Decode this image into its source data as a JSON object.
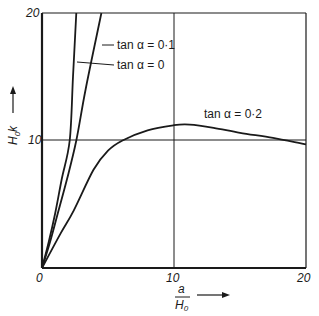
{
  "chart_data": {
    "type": "line",
    "title": "",
    "xlabel": "a/H0",
    "ylabel": "H0k",
    "xlim": [
      0,
      20
    ],
    "ylim": [
      0,
      20
    ],
    "x_ticks": [
      "0",
      "10",
      "20"
    ],
    "y_ticks": [
      "10",
      "20"
    ],
    "grid": "gridlines at x=10 and y=10",
    "legend": "inline labels with leader lines",
    "series": [
      {
        "name": "tan α = 0",
        "label": "tan α = 0",
        "points": [
          [
            0,
            0
          ],
          [
            0.5,
            2.0
          ],
          [
            1.0,
            4.3
          ],
          [
            1.5,
            7.0
          ],
          [
            2.1,
            10.0
          ],
          [
            2.35,
            15.0
          ],
          [
            2.6,
            20.0
          ]
        ]
      },
      {
        "name": "tan α = 0·1",
        "label": "tan α = 0·1",
        "points": [
          [
            0,
            0
          ],
          [
            0.6,
            2.0
          ],
          [
            1.2,
            4.3
          ],
          [
            1.9,
            7.0
          ],
          [
            2.6,
            10.0
          ],
          [
            3.3,
            14.0
          ],
          [
            4.5,
            20.0
          ]
        ]
      },
      {
        "name": "tan α = 0·2",
        "label": "tan α = 0·2",
        "points": [
          [
            0,
            0
          ],
          [
            1.4,
            2.7
          ],
          [
            2.4,
            4.5
          ],
          [
            3.9,
            7.7
          ],
          [
            5.0,
            9.2
          ],
          [
            6.1,
            10.0
          ],
          [
            8.0,
            10.8
          ],
          [
            10.0,
            11.2
          ],
          [
            11.2,
            11.25
          ],
          [
            13.0,
            11.0
          ],
          [
            15.0,
            10.6
          ],
          [
            17.5,
            10.2
          ],
          [
            20.0,
            9.7
          ]
        ]
      }
    ]
  },
  "labels": {
    "tan0": "tan α = 0",
    "tan01": "tan α = 0·1",
    "tan02": "tan α = 0·2",
    "tick_x0": "0",
    "tick_x10": "10",
    "tick_x20": "20",
    "tick_y10": "10",
    "tick_y20": "20",
    "ylabel_main": "H",
    "ylabel_sub": "0",
    "ylabel_tail": "k",
    "xlabel_num": "a",
    "xlabel_den": "H",
    "xlabel_den_sub": "0"
  }
}
